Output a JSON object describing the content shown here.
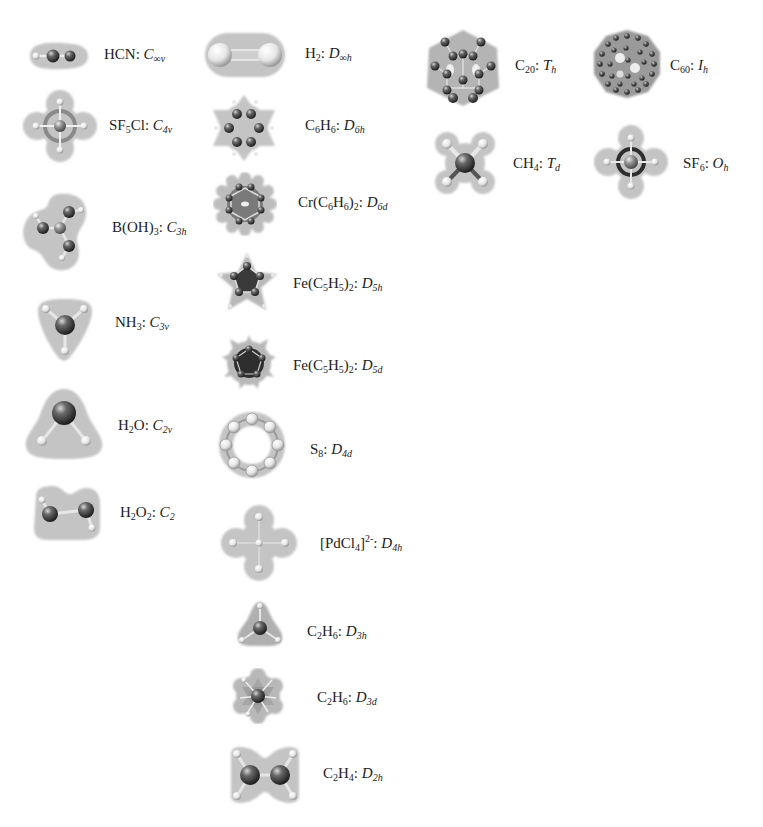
{
  "figure": {
    "columns": [
      {
        "id": "left",
        "items": [
          {
            "id": "hcn",
            "formula": "HCN",
            "group_letter": "C",
            "group_sub": "∞v",
            "icon": "hcn-molecule-icon"
          },
          {
            "id": "sf5cl",
            "formula": "SF5Cl",
            "group_letter": "C",
            "group_sub": "4v",
            "icon": "sf5cl-molecule-icon"
          },
          {
            "id": "boh3",
            "formula": "B(OH)3",
            "group_letter": "C",
            "group_sub": "3h",
            "icon": "boric-acid-molecule-icon"
          },
          {
            "id": "nh3",
            "formula": "NH3",
            "group_letter": "C",
            "group_sub": "3v",
            "icon": "ammonia-molecule-icon"
          },
          {
            "id": "h2o",
            "formula": "H2O",
            "group_letter": "C",
            "group_sub": "2v",
            "icon": "water-molecule-icon"
          },
          {
            "id": "h2o2",
            "formula": "H2O2",
            "group_letter": "C",
            "group_sub": "2",
            "icon": "hydrogen-peroxide-molecule-icon"
          }
        ]
      },
      {
        "id": "middle",
        "items": [
          {
            "id": "h2",
            "formula": "H2",
            "group_letter": "D",
            "group_sub": "∞h",
            "icon": "hydrogen-molecule-icon"
          },
          {
            "id": "c6h6",
            "formula": "C6H6",
            "group_letter": "D",
            "group_sub": "6h",
            "icon": "benzene-molecule-icon"
          },
          {
            "id": "crc6h6",
            "formula": "Cr(C6H6)2",
            "group_letter": "D",
            "group_sub": "6d",
            "icon": "dibenzenechromium-molecule-icon"
          },
          {
            "id": "fec5h5_ecl",
            "formula": "Fe(C5H5)2",
            "group_letter": "D",
            "group_sub": "5h",
            "icon": "ferrocene-eclipsed-molecule-icon"
          },
          {
            "id": "fec5h5_stag",
            "formula": "Fe(C5H5)2",
            "group_letter": "D",
            "group_sub": "5d",
            "icon": "ferrocene-staggered-molecule-icon"
          },
          {
            "id": "s8",
            "formula": "S8",
            "group_letter": "D",
            "group_sub": "4d",
            "icon": "s8-ring-molecule-icon"
          },
          {
            "id": "pdcl4",
            "formula": "[PdCl4]2-",
            "group_letter": "D",
            "group_sub": "4h",
            "icon": "tetrachloropalladate-molecule-icon"
          },
          {
            "id": "c2h6_ecl",
            "formula": "C2H6",
            "group_letter": "D",
            "group_sub": "3h",
            "icon": "ethane-eclipsed-molecule-icon"
          },
          {
            "id": "c2h6_stag",
            "formula": "C2H6",
            "group_letter": "D",
            "group_sub": "3d",
            "icon": "ethane-staggered-molecule-icon"
          },
          {
            "id": "c2h4",
            "formula": "C2H4",
            "group_letter": "D",
            "group_sub": "2h",
            "icon": "ethylene-molecule-icon"
          }
        ]
      },
      {
        "id": "right",
        "items": [
          {
            "id": "c20",
            "formula": "C20",
            "group_letter": "T",
            "group_sub": "h",
            "icon": "c20-fullerene-molecule-icon"
          },
          {
            "id": "c60",
            "formula": "C60",
            "group_letter": "I",
            "group_sub": "h",
            "icon": "c60-fullerene-molecule-icon"
          },
          {
            "id": "ch4",
            "formula": "CH4",
            "group_letter": "T",
            "group_sub": "d",
            "icon": "methane-molecule-icon"
          },
          {
            "id": "sf6",
            "formula": "SF6",
            "group_letter": "O",
            "group_sub": "h",
            "icon": "sf6-molecule-icon"
          }
        ]
      }
    ],
    "labels": {
      "hcn": {
        "pre": "HCN",
        "sub1": "",
        "mid": "",
        "sub2": "",
        "post": ": ",
        "g": "C",
        "gs": "∞v"
      },
      "sf5cl": {
        "pre": "SF",
        "sub1": "5",
        "mid": "Cl",
        "sub2": "",
        "post": ": ",
        "g": "C",
        "gs": "4v"
      },
      "boh3": {
        "pre": "B(OH)",
        "sub1": "3",
        "mid": "",
        "sub2": "",
        "post": ": ",
        "g": "C",
        "gs": "3h"
      },
      "nh3": {
        "pre": "NH",
        "sub1": "3",
        "mid": "",
        "sub2": "",
        "post": ": ",
        "g": "C",
        "gs": "3v"
      },
      "h2o": {
        "pre": "H",
        "sub1": "2",
        "mid": "O",
        "sub2": "",
        "post": ": ",
        "g": "C",
        "gs": "2v"
      },
      "h2o2": {
        "pre": "H",
        "sub1": "2",
        "mid": "O",
        "sub2": "2",
        "post": ": ",
        "g": "C",
        "gs": "2"
      },
      "h2": {
        "pre": "H",
        "sub1": "2",
        "mid": "",
        "sub2": "",
        "post": ": ",
        "g": "D",
        "gs": "∞h"
      },
      "c6h6": {
        "pre": "C",
        "sub1": "6",
        "mid": "H",
        "sub2": "6",
        "post": ": ",
        "g": "D",
        "gs": "6h"
      },
      "crc6h6": {
        "pre": "Cr(C",
        "sub1": "6",
        "mid": "H",
        "sub2": "6",
        "post3": ")",
        "sub3": "2",
        "post": ": ",
        "g": "D",
        "gs": "6d"
      },
      "fec5h5_ecl": {
        "pre": "Fe(C",
        "sub1": "5",
        "mid": "H",
        "sub2": "5",
        "post3": ")",
        "sub3": "2",
        "post": ": ",
        "g": "D",
        "gs": "5h"
      },
      "fec5h5_stag": {
        "pre": "Fe(C",
        "sub1": "5",
        "mid": "H",
        "sub2": "5",
        "post3": ")",
        "sub3": "2",
        "post": ": ",
        "g": "D",
        "gs": "5d"
      },
      "s8": {
        "pre": "S",
        "sub1": "8",
        "mid": "",
        "sub2": "",
        "post": ": ",
        "g": "D",
        "gs": "4d"
      },
      "pdcl4": {
        "pre": "[PdCl",
        "sub1": "4",
        "mid": "]",
        "sup": "2-",
        "sub2": "",
        "post": ": ",
        "g": "D",
        "gs": "4h"
      },
      "c2h6_ecl": {
        "pre": "C",
        "sub1": "2",
        "mid": "H",
        "sub2": "6",
        "post": ": ",
        "g": "D",
        "gs": "3h"
      },
      "c2h6_stag": {
        "pre": "C",
        "sub1": "2",
        "mid": "H",
        "sub2": "6",
        "post": ": ",
        "g": "D",
        "gs": "3d"
      },
      "c2h4": {
        "pre": "C",
        "sub1": "2",
        "mid": "H",
        "sub2": "4",
        "post": ": ",
        "g": "D",
        "gs": "2h"
      },
      "c20": {
        "pre": "C",
        "sub1": "20",
        "mid": "",
        "sub2": "",
        "post": ": ",
        "g": "T",
        "gs": "h"
      },
      "c60": {
        "pre": "C",
        "sub1": "60",
        "mid": "",
        "sub2": "",
        "post": ": ",
        "g": "I",
        "gs": "h"
      },
      "ch4": {
        "pre": "CH",
        "sub1": "4",
        "mid": "",
        "sub2": "",
        "post": ": ",
        "g": "T",
        "gs": "d"
      },
      "sf6": {
        "pre": "SF",
        "sub1": "6",
        "mid": "",
        "sub2": "",
        "post": ": ",
        "g": "O",
        "gs": "h"
      }
    },
    "colors": {
      "halo": "#c4c4c4",
      "halo_dark": "#a9a9a9",
      "atom_dark": "#3a3a3a",
      "atom_light": "#f4f4f4",
      "text": "#222222"
    }
  }
}
